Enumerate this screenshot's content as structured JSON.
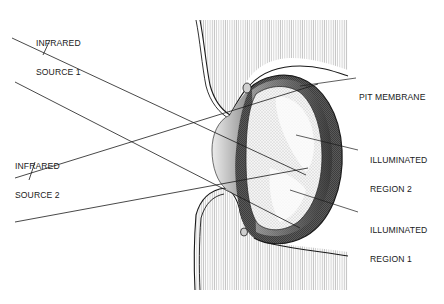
{
  "diagram": {
    "type": "anatomical cross-section",
    "labels": {
      "source1": [
        "INFRARED",
        "SOURCE 1"
      ],
      "source2": [
        "INFRARED",
        "SOURCE 2"
      ],
      "pit_membrane": "PIT MEMBRANE",
      "region2": [
        "ILLUMINATED",
        "REGION 2"
      ],
      "region1": [
        "ILLUMINATED",
        "REGION 1"
      ]
    },
    "colors": {
      "ink": "#1a1a1a",
      "background": "#ffffff",
      "tissue_shade": "#e8e8e8",
      "dark_cavity": "#4a4a4a"
    }
  }
}
